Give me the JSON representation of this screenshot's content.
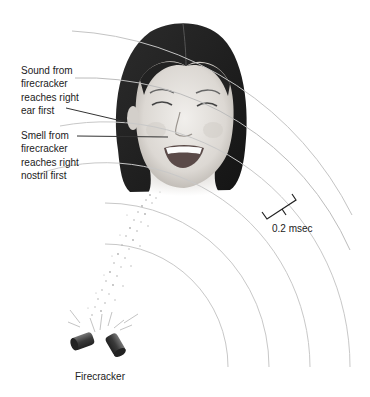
{
  "labels": {
    "sound": {
      "lines": [
        "Sound from",
        "firecracker",
        "reaches right",
        "ear first"
      ]
    },
    "smell": {
      "lines": [
        "Smell from",
        "firecracker",
        "reaches right",
        "nostril first"
      ]
    },
    "scale": "0.2 msec",
    "source": "Firecracker"
  },
  "diagram": {
    "wavefront_center": [
      105,
      367
    ],
    "wavefront_radii": [
      123,
      164,
      205,
      245,
      290,
      330
    ],
    "colors": {
      "wavefront": "#c8c8c8",
      "leader_line": "#333333",
      "hair": "#1e1e1e",
      "skin": "#e6e3df",
      "odor_particles": "#b0b0b0",
      "firecracker": "#444444"
    }
  }
}
